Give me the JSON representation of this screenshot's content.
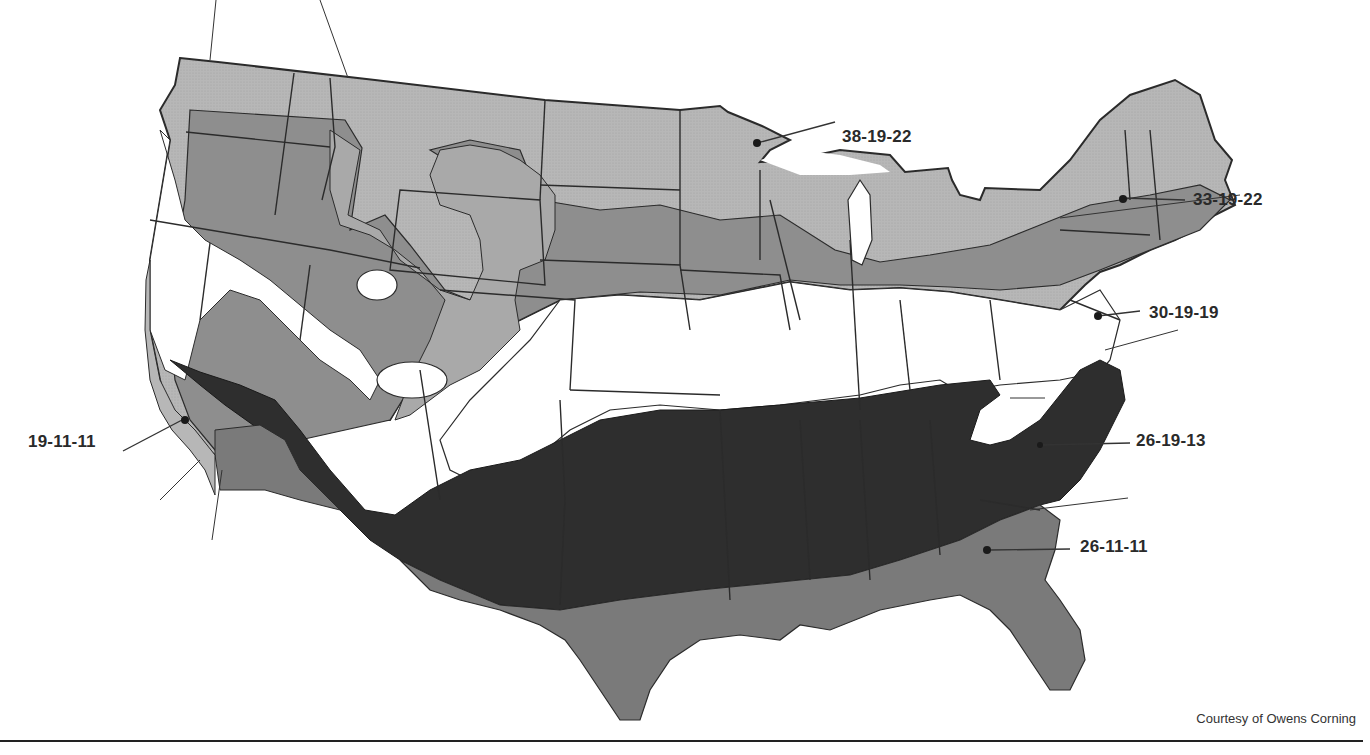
{
  "figure": {
    "credit": "Courtesy of Owens Corning",
    "colors": {
      "background": "#ffffff",
      "zone_light": "#b7b7b7",
      "zone_medium": "#8e8e8e",
      "zone_dark_gray": "#777777",
      "zone_darkest": "#2e2e2e",
      "zone_white": "#ffffff",
      "border": "#2b2b2b"
    }
  },
  "labels": [
    {
      "id": "minnesota",
      "text": "38-19-22",
      "x": 842,
      "y": 137
    },
    {
      "id": "new-england",
      "text": "33-19-22",
      "x": 1193,
      "y": 190
    },
    {
      "id": "mid-atlantic",
      "text": "30-19-19",
      "x": 1149,
      "y": 303
    },
    {
      "id": "california",
      "text": "19-11-11",
      "x": 28,
      "y": 432
    },
    {
      "id": "carolinas",
      "text": "26-19-13",
      "x": 1136,
      "y": 431
    },
    {
      "id": "georgia",
      "text": "26-11-11",
      "x": 1080,
      "y": 536
    }
  ],
  "legend_meaning": "Ceiling R-value - Wall R-value - Floor R-value"
}
